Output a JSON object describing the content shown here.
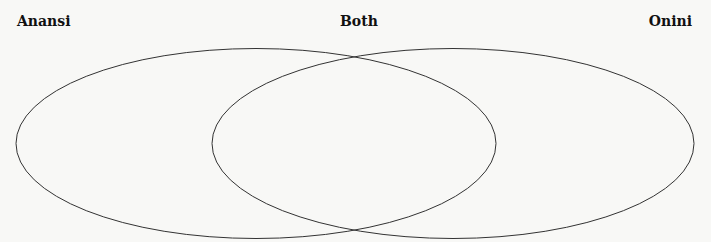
{
  "diagram": {
    "type": "venn",
    "labels": {
      "left": "Anansi",
      "center": "Both",
      "right": "Onini"
    },
    "sets": [
      {
        "name": "Anansi",
        "cx": 256,
        "cy": 143.5,
        "rx": 240,
        "ry": 95
      },
      {
        "name": "Onini",
        "cx": 453,
        "cy": 143.5,
        "rx": 241,
        "ry": 95
      }
    ],
    "colors": {
      "background": "#f8f8f6",
      "stroke": "#333333",
      "text": "#111111"
    }
  }
}
